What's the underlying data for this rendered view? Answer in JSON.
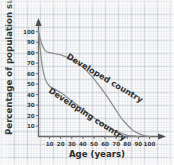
{
  "chart_data": {
    "type": "line",
    "title": "",
    "xlabel": "Age (years)",
    "ylabel": "Percentage of population surviving",
    "xlim": [
      0,
      105
    ],
    "ylim": [
      0,
      105
    ],
    "xticks": [
      10,
      20,
      30,
      40,
      50,
      60,
      70,
      80,
      90,
      100
    ],
    "yticks": [
      10,
      20,
      30,
      40,
      50,
      60,
      70,
      80,
      90,
      100
    ],
    "xtick_labels": [
      "10",
      "20",
      "30",
      "40",
      "50",
      "60",
      "70",
      "80",
      "90",
      "100"
    ],
    "ytick_labels": [
      "10",
      "20",
      "30",
      "40",
      "50",
      "60",
      "70",
      "80",
      "90",
      "100"
    ],
    "grid": true,
    "grid_style": "graph-paper",
    "legend": "inline-curve-labels",
    "annotations": [
      {
        "text": "Developed country",
        "curve": "developed"
      },
      {
        "text": "Developing country",
        "curve": "developing"
      }
    ],
    "series": [
      {
        "name": "Developed country",
        "label": "Developed country",
        "color": "#8d8d8d",
        "x": [
          0,
          3,
          6,
          10,
          15,
          20,
          25,
          30,
          35,
          40,
          45,
          50,
          55,
          60,
          65,
          70,
          75,
          80,
          85,
          90,
          95,
          100
        ],
        "values": [
          100,
          88,
          82,
          80,
          79,
          78,
          76,
          73,
          70,
          66,
          61,
          55,
          48,
          41,
          33,
          25,
          17,
          11,
          6,
          3,
          1,
          0
        ]
      },
      {
        "name": "Developing country",
        "label": "Developing country",
        "color": "#8d8d8d",
        "x": [
          0,
          3,
          6,
          10,
          15,
          20,
          25,
          30,
          35,
          40,
          45,
          50,
          55,
          60,
          65,
          70,
          75,
          80,
          85,
          90
        ],
        "values": [
          100,
          70,
          55,
          48,
          45,
          42,
          38,
          34,
          30,
          26,
          22,
          18,
          14,
          11,
          8,
          5,
          3,
          1,
          0.5,
          0
        ]
      }
    ]
  },
  "axes": {
    "x_title": "Age (years)",
    "y_title": "Percentage of population surviving"
  }
}
